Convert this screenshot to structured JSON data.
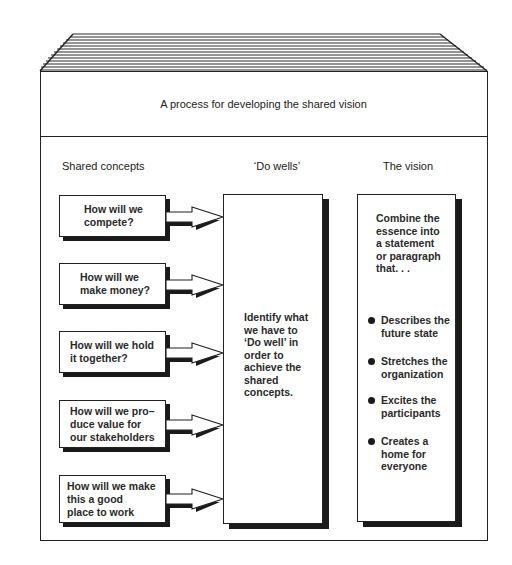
{
  "diagram": {
    "title": "A process for developing the shared vision",
    "columns": {
      "shared_concepts": "Shared concepts",
      "do_wells": "‘Do wells’",
      "vision": "The vision"
    },
    "shared_concepts": [
      {
        "lines": [
          "How will we",
          "compete?"
        ]
      },
      {
        "lines": [
          "How will we",
          "make money?"
        ]
      },
      {
        "lines": [
          "How will we hold",
          "it together?"
        ]
      },
      {
        "lines": [
          "How will we pro–",
          "duce value for",
          "our stakeholders"
        ]
      },
      {
        "lines": [
          "How will we make",
          "this a good",
          "place to work"
        ]
      }
    ],
    "do_wells_text": [
      "Identify what",
      "we have to",
      "‘Do well’ in",
      "order to",
      "achieve the",
      "shared",
      "concepts."
    ],
    "vision_intro": [
      "Combine the",
      "essence into",
      "a statement",
      "or paragraph",
      "that. . ."
    ],
    "vision_bullets": [
      {
        "lines": [
          "Describes the",
          "future state"
        ]
      },
      {
        "lines": [
          "Stretches the",
          "organization"
        ]
      },
      {
        "lines": [
          "Excites the",
          "participants"
        ]
      },
      {
        "lines": [
          "Creates a",
          "home for",
          "everyone"
        ]
      }
    ],
    "icons": {
      "roof": "hatched-roof-icon",
      "arrow": "right-arrow-icon",
      "bullet": "filled-circle-bullet-icon"
    },
    "colors": {
      "ink": "#1a1a1a",
      "paper": "#ffffff"
    }
  }
}
